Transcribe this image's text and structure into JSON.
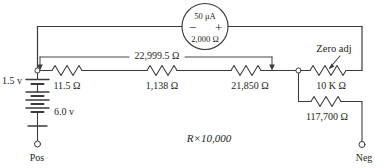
{
  "diagram": {
    "title_note": "R×10,000",
    "meter": {
      "current_rating": "50 μA",
      "resistance": "2,000 Ω",
      "negative_terminal": "−",
      "positive_terminal": "+"
    },
    "span_label": "22,999.5 Ω",
    "batteries": [
      {
        "name": "battery-1p5v",
        "label": "1.5 v"
      },
      {
        "name": "battery-6v",
        "label": "6.0 v"
      }
    ],
    "resistors": [
      {
        "name": "resistor-11-5",
        "label": "11.5 Ω"
      },
      {
        "name": "resistor-1138",
        "label": "1,138 Ω"
      },
      {
        "name": "resistor-21850",
        "label": "21,850 Ω"
      },
      {
        "name": "potentiometer-10k",
        "label": "10 K Ω"
      },
      {
        "name": "resistor-117700",
        "label": "117,700 Ω"
      }
    ],
    "zero_adj_label": "Zero adj",
    "terminals": [
      {
        "name": "terminal-pos",
        "label": "Pos"
      },
      {
        "name": "terminal-neg",
        "label": "Neg"
      }
    ],
    "colors": {
      "wire": "#3b3b3b",
      "text": "#231f20",
      "background": "#ffffff"
    }
  }
}
